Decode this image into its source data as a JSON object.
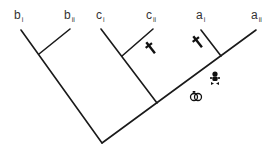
{
  "diagram": {
    "type": "phylogenetic-tree",
    "line_color": "#1a1a1a",
    "labels": [
      {
        "id": "bi",
        "base": "b",
        "sub": "i",
        "x": 14,
        "y": 9
      },
      {
        "id": "bii",
        "base": "b",
        "sub": "ii",
        "x": 64,
        "y": 9
      },
      {
        "id": "ci",
        "base": "c",
        "sub": "i",
        "x": 96,
        "y": 9
      },
      {
        "id": "cii",
        "base": "c",
        "sub": "ii",
        "x": 146,
        "y": 9
      },
      {
        "id": "ai",
        "base": "a",
        "sub": "i",
        "x": 196,
        "y": 9
      },
      {
        "id": "aii",
        "base": "a",
        "sub": "ii",
        "x": 251,
        "y": 9
      }
    ],
    "icons": [
      {
        "name": "dagger-icon",
        "meaning": "extinction",
        "x": 150,
        "y": 47
      },
      {
        "name": "dagger-icon",
        "meaning": "extinction",
        "x": 196,
        "y": 39
      },
      {
        "name": "baby-icon",
        "meaning": "birth",
        "x": 215,
        "y": 78
      },
      {
        "name": "rings-icon",
        "meaning": "marriage",
        "x": 196,
        "y": 95
      }
    ]
  }
}
